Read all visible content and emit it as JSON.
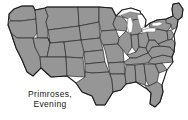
{
  "image": {
    "kind": "map",
    "subject": "Contiguous United States distribution map",
    "width": 188,
    "height": 120,
    "background_color": "#ffffff"
  },
  "map": {
    "region_label": "United States (lower 48)",
    "land_fill_color": "#969696",
    "border_color": "#2b2b2b",
    "outline_color": "#1e1e1e",
    "water_fill_color": "#ffffff",
    "water_features": [
      "Lake Superior",
      "Lake Michigan",
      "Lake Huron",
      "Lake Erie",
      "Lake Ontario"
    ],
    "shading_note": "All states shaded uniformly gray"
  },
  "caption": {
    "lines": [
      "Primroses,",
      "Evening"
    ],
    "line1": "Primroses,",
    "line2": "Evening",
    "text_color": "#1a1a1a",
    "position": "lower-left"
  }
}
